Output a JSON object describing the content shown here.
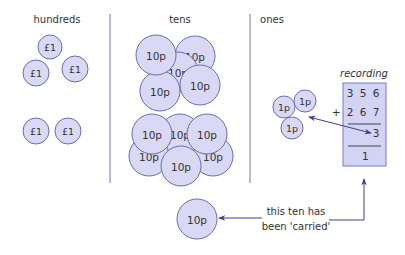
{
  "columns": [
    {
      "label": "hundreds",
      "x": 57,
      "y": 20
    },
    {
      "label": "tens",
      "x": 180,
      "y": 20
    },
    {
      "label": "ones",
      "x": 272,
      "y": 20
    }
  ],
  "dividers": [
    {
      "x": 110,
      "y1": 14,
      "y2": 183
    },
    {
      "x": 250,
      "y1": 14,
      "y2": 183
    }
  ],
  "coins": {
    "hundreds": [
      {
        "label": "£1",
        "cx": 50,
        "cy": 47,
        "r": 12
      },
      {
        "label": "£1",
        "cx": 36,
        "cy": 73,
        "r": 13
      },
      {
        "label": "£1",
        "cx": 75,
        "cy": 69,
        "r": 13
      },
      {
        "label": "£1",
        "cx": 36,
        "cy": 131,
        "r": 13
      },
      {
        "label": "£1",
        "cx": 68,
        "cy": 131,
        "r": 13
      }
    ],
    "tens": [
      {
        "label": "10p",
        "cx": 195,
        "cy": 56,
        "r": 20
      },
      {
        "label": "10p",
        "cx": 178,
        "cy": 72,
        "r": 20
      },
      {
        "label": "10p",
        "cx": 160,
        "cy": 91,
        "r": 20
      },
      {
        "label": "10p",
        "cx": 156,
        "cy": 55,
        "r": 20
      },
      {
        "label": "10p",
        "cx": 200,
        "cy": 85,
        "r": 20
      },
      {
        "label": "10p",
        "cx": 180,
        "cy": 134,
        "r": 20
      },
      {
        "label": "10p",
        "cx": 149,
        "cy": 156,
        "r": 20
      },
      {
        "label": "10p",
        "cx": 213,
        "cy": 156,
        "r": 20
      },
      {
        "label": "10p",
        "cx": 181,
        "cy": 166,
        "r": 20
      },
      {
        "label": "10p",
        "cx": 152,
        "cy": 134,
        "r": 20
      },
      {
        "label": "10p",
        "cx": 207,
        "cy": 134,
        "r": 20
      }
    ],
    "ones": [
      {
        "label": "1p",
        "cx": 284,
        "cy": 107,
        "r": 11
      },
      {
        "label": "1p",
        "cx": 305,
        "cy": 101,
        "r": 11
      },
      {
        "label": "1p",
        "cx": 292,
        "cy": 128,
        "r": 11
      }
    ],
    "carried": {
      "label": "10p",
      "cx": 197,
      "cy": 219,
      "r": 20
    }
  },
  "recording": {
    "title": "recording",
    "top_number": "3 5 6",
    "addend": "+ 2 6 7",
    "answer_ones": "3",
    "carry": "1"
  },
  "annotation": {
    "line1": "this ten has",
    "line2": "been 'carried'"
  },
  "colors": {
    "coin_fill": "#d9d9f5",
    "coin_stroke": "#6b6bb0",
    "box_fill": "#d3d3f3",
    "box_stroke": "#7a7ac2",
    "divider": "#8a8ac8",
    "arrow": "#3c3c90"
  }
}
